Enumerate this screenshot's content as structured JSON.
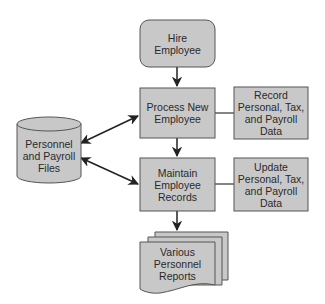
{
  "diagram": {
    "type": "flowchart",
    "colors": {
      "fill": "#c8c8c8",
      "stroke": "#555555",
      "text": "#2a2a2a",
      "line": "#222222"
    },
    "nodes": {
      "hire": {
        "label": "Hire\nEmployee",
        "shape": "rounded-rectangle"
      },
      "process": {
        "label": "Process New\nEmployee",
        "shape": "rectangle"
      },
      "record": {
        "label": "Record\nPersonal, Tax,\nand Payroll\nData",
        "shape": "rectangle"
      },
      "maintain": {
        "label": "Maintain\nEmployee\nRecords",
        "shape": "rectangle"
      },
      "update": {
        "label": "Update\nPersonal, Tax,\nand Payroll\nData",
        "shape": "rectangle"
      },
      "files": {
        "label": "Personnel\nand Payroll\nFiles",
        "shape": "cylinder"
      },
      "reports": {
        "label": "Various\nPersonnel\nReports",
        "shape": "multi-document"
      }
    },
    "edges": [
      {
        "from": "hire",
        "to": "process",
        "type": "arrow"
      },
      {
        "from": "process",
        "to": "maintain",
        "type": "arrow"
      },
      {
        "from": "maintain",
        "to": "reports",
        "type": "arrow"
      },
      {
        "from": "process",
        "to": "record",
        "type": "line"
      },
      {
        "from": "maintain",
        "to": "update",
        "type": "line"
      },
      {
        "from": "files",
        "to": "process",
        "type": "bidirectional-arrow"
      },
      {
        "from": "files",
        "to": "maintain",
        "type": "bidirectional-arrow"
      }
    ]
  }
}
